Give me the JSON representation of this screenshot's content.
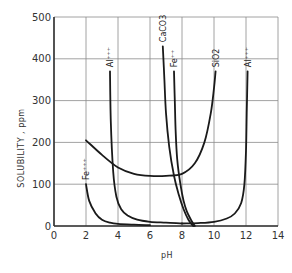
{
  "chart_data": {
    "type": "line",
    "title": "",
    "xlabel": "pH",
    "ylabel": "SOLUBILITY , ppm",
    "xlim": [
      0,
      14
    ],
    "ylim": [
      0,
      500
    ],
    "xticks": [
      "0",
      "2",
      "4",
      "6",
      "8",
      "10",
      "12",
      "14"
    ],
    "yticks": [
      "0",
      "100",
      "200",
      "300",
      "400",
      "500"
    ],
    "grid": true,
    "legend": "none (curves labeled directly)",
    "series": [
      {
        "name": "Fe+++",
        "label": "Fe⁺⁺⁺",
        "x": [
          2.0,
          2.2,
          2.6,
          3.0,
          3.5,
          4.0,
          5.0,
          6.0
        ],
        "y": [
          100,
          60,
          30,
          15,
          8,
          5,
          3,
          2
        ]
      },
      {
        "name": "Al+++ (acid)",
        "label": "Al⁺⁺⁺",
        "x": [
          3.5,
          3.55,
          3.7,
          3.9,
          4.2,
          4.6,
          5.2,
          6.0,
          7.0,
          8.0
        ],
        "y": [
          370,
          250,
          130,
          70,
          40,
          25,
          15,
          10,
          8,
          6
        ]
      },
      {
        "name": "Al+++ (alkaline)",
        "label": "Al⁺⁺⁺",
        "x": [
          8.0,
          9.0,
          10.0,
          10.8,
          11.3,
          11.7,
          11.9,
          12.0,
          12.05,
          12.1
        ],
        "y": [
          6,
          7,
          10,
          18,
          30,
          55,
          100,
          180,
          280,
          370
        ]
      },
      {
        "name": "SiO2",
        "label": "SiO2",
        "x": [
          2.0,
          3.0,
          4.0,
          5.0,
          6.0,
          7.0,
          8.0,
          8.8,
          9.4,
          9.8,
          10.0,
          10.1
        ],
        "y": [
          205,
          170,
          140,
          125,
          120,
          120,
          125,
          150,
          200,
          270,
          330,
          370
        ]
      },
      {
        "name": "CaCO3",
        "label": "CaCO3",
        "x": [
          6.8,
          6.9,
          7.0,
          7.2,
          7.5,
          7.8,
          8.1,
          8.4,
          8.7
        ],
        "y": [
          430,
          350,
          270,
          190,
          120,
          75,
          40,
          15,
          0
        ]
      },
      {
        "name": "Fe++",
        "label": "Fe⁺⁺",
        "x": [
          7.5,
          7.55,
          7.6,
          7.7,
          7.9,
          8.1,
          8.3,
          8.6,
          8.8
        ],
        "y": [
          370,
          300,
          230,
          160,
          100,
          60,
          35,
          12,
          0
        ]
      }
    ],
    "colors": {
      "curve": "#1a1a1a",
      "grid": "#8a8a8a",
      "axis": "#333333"
    }
  }
}
